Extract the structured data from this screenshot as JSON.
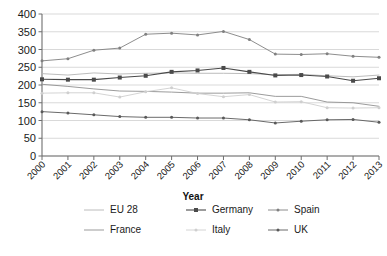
{
  "chart_data": {
    "type": "line",
    "title": "",
    "xlabel": "Year",
    "ylabel": "",
    "categories": [
      "2000",
      "2001",
      "2002",
      "2003",
      "2004",
      "2005",
      "2006",
      "2007",
      "2008",
      "2009",
      "2010",
      "2011",
      "2012",
      "2013"
    ],
    "x": [
      2000,
      2001,
      2002,
      2003,
      2004,
      2005,
      2006,
      2007,
      2008,
      2009,
      2010,
      2011,
      2012,
      2013
    ],
    "ylim": [
      0,
      400
    ],
    "ytick_labels": [
      "400",
      "350",
      "300",
      "250",
      "200",
      "150",
      "100",
      "50",
      "0"
    ],
    "ytick_values": [
      400,
      350,
      300,
      250,
      200,
      150,
      100,
      50,
      0
    ],
    "grid": true,
    "legend_position": "bottom",
    "series": [
      {
        "name": "EU 28",
        "color": "#b4b4b4",
        "marker": "none",
        "values": [
          232,
          228,
          234,
          231,
          233,
          234,
          233,
          233,
          232,
          229,
          230,
          226,
          223,
          228
        ]
      },
      {
        "name": "Germany",
        "color": "#4a4a4a",
        "marker": "square",
        "values": [
          216,
          215,
          215,
          221,
          226,
          237,
          241,
          248,
          237,
          227,
          228,
          224,
          212,
          219
        ]
      },
      {
        "name": "Spain",
        "color": "#808080",
        "marker": "dot",
        "values": [
          268,
          274,
          298,
          304,
          343,
          346,
          341,
          351,
          328,
          287,
          286,
          288,
          281,
          278
        ]
      },
      {
        "name": "France",
        "color": "#909090",
        "marker": "none",
        "values": [
          202,
          196,
          189,
          183,
          182,
          180,
          177,
          177,
          178,
          168,
          168,
          152,
          150,
          140
        ]
      },
      {
        "name": "Italy",
        "color": "#cfcfcf",
        "marker": "dot",
        "values": [
          177,
          178,
          178,
          166,
          181,
          192,
          176,
          167,
          173,
          152,
          153,
          136,
          135,
          136
        ]
      },
      {
        "name": "UK",
        "color": "#595959",
        "marker": "dot",
        "values": [
          125,
          121,
          116,
          111,
          109,
          109,
          107,
          107,
          102,
          93,
          98,
          102,
          103,
          95
        ]
      }
    ]
  },
  "legend": {
    "entries": [
      {
        "label": "EU 28"
      },
      {
        "label": "Germany"
      },
      {
        "label": "Spain"
      },
      {
        "label": "France"
      },
      {
        "label": "Italy"
      },
      {
        "label": "UK"
      }
    ]
  }
}
